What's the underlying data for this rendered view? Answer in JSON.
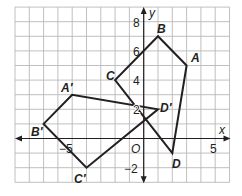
{
  "figure": {
    "grid": {
      "x_min": -9,
      "x_max": 6,
      "y_min": -3,
      "y_max": 9,
      "color": "#b9b9b9"
    },
    "axes": {
      "x_label": "x",
      "y_label": "y",
      "origin_label": "O",
      "x_ticks": [
        {
          "value": -5,
          "label": "−5"
        },
        {
          "value": 5,
          "label": "5"
        }
      ],
      "y_ticks": [
        {
          "value": 8,
          "label": "8"
        },
        {
          "value": 6,
          "label": "6"
        },
        {
          "value": 4,
          "label": "4"
        },
        {
          "value": 2,
          "label": "2"
        },
        {
          "value": -2,
          "label": "−2"
        }
      ]
    },
    "polygons": [
      {
        "name": "ABCD",
        "vertices": [
          {
            "label": "A",
            "x": 3,
            "y": 5
          },
          {
            "label": "B",
            "x": 1,
            "y": 7
          },
          {
            "label": "C",
            "x": -2,
            "y": 4
          },
          {
            "label": "D",
            "x": 2,
            "y": -1
          }
        ]
      },
      {
        "name": "A'B'C'D'",
        "vertices": [
          {
            "label": "A′",
            "x": -5,
            "y": 3
          },
          {
            "label": "B′",
            "x": -7,
            "y": 1
          },
          {
            "label": "C′",
            "x": -4,
            "y": -2
          },
          {
            "label": "D′",
            "x": 1,
            "y": 2
          }
        ]
      }
    ],
    "line_color": "#231f20"
  }
}
